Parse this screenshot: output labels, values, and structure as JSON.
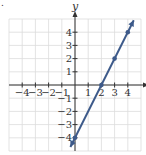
{
  "figure_marker": ".",
  "chart_data": {
    "type": "line",
    "title": "",
    "equation": "y = 2x - 4",
    "xlabel": "x",
    "ylabel": "y",
    "xlim": [
      -5,
      5
    ],
    "ylim": [
      -5,
      5
    ],
    "grid": true,
    "x_tick_labels": [
      "-4",
      "-3",
      "-2",
      "-1",
      "1",
      "2",
      "3",
      "4"
    ],
    "y_tick_labels": [
      "4",
      "3",
      "2",
      "1",
      "-1",
      "-2",
      "-3",
      "-4"
    ],
    "x_ticks": [
      -4,
      -3,
      -2,
      -1,
      1,
      2,
      3,
      4
    ],
    "y_ticks": [
      4,
      3,
      2,
      1,
      -1,
      -2,
      -3,
      -4
    ],
    "points": [
      {
        "x": 0,
        "y": -4
      },
      {
        "x": 2,
        "y": 0
      },
      {
        "x": 3,
        "y": 2
      },
      {
        "x": 4,
        "y": 4
      }
    ],
    "line": {
      "x": [
        -0.35,
        4.45
      ],
      "y": [
        -4.7,
        4.9
      ]
    },
    "colors": {
      "line": "#3d5a8a",
      "grid": "#dcdcdc",
      "axis": "#333333"
    }
  }
}
